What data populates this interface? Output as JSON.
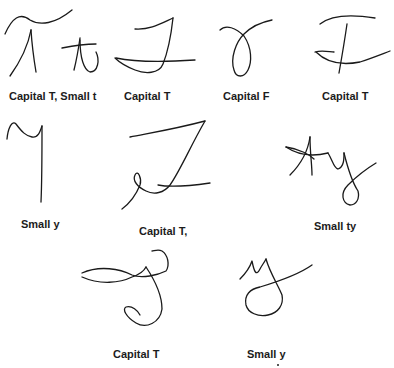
{
  "figure": {
    "samples": [
      {
        "id": 1,
        "label": "Capital T, Small t"
      },
      {
        "id": 2,
        "label": "Capital T"
      },
      {
        "id": 3,
        "label": "Capital F"
      },
      {
        "id": 4,
        "label": "Capital T"
      },
      {
        "id": 5,
        "label": "Small y"
      },
      {
        "id": 6,
        "label": "Capital T,"
      },
      {
        "id": 7,
        "label": "Small ty"
      },
      {
        "id": 8,
        "label": "Capital T"
      },
      {
        "id": 9,
        "label": "Small y"
      }
    ],
    "stroke_color": "#1a1a1a",
    "background_color": "#ffffff"
  }
}
